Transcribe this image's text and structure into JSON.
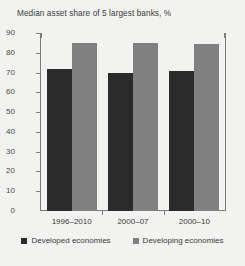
{
  "chart_data": {
    "type": "bar",
    "title": "Median asset share of 5 largest banks, %",
    "xlabel": "",
    "ylabel": "",
    "ylim": [
      0,
      90
    ],
    "yticks": [
      0,
      10,
      20,
      30,
      40,
      50,
      60,
      70,
      80,
      90
    ],
    "ytick_labels": [
      "0",
      "10",
      "20",
      "30",
      "40",
      "50",
      "60",
      "70",
      "80",
      "90"
    ],
    "grid": false,
    "legend_position": "bottom",
    "categories": [
      "1996–2010",
      "2000–07",
      "2000–10"
    ],
    "series": [
      {
        "name": "Developed economies",
        "color": "#2b2b2b",
        "values": [
          72,
          70,
          71
        ]
      },
      {
        "name": "Developing economies",
        "color": "#808080",
        "values": [
          85,
          85,
          84.5
        ]
      }
    ]
  },
  "figure": {
    "background_color": "#f2f2f0",
    "axis_color": "#7c7c7c",
    "text_color": "#3b3b3b"
  }
}
